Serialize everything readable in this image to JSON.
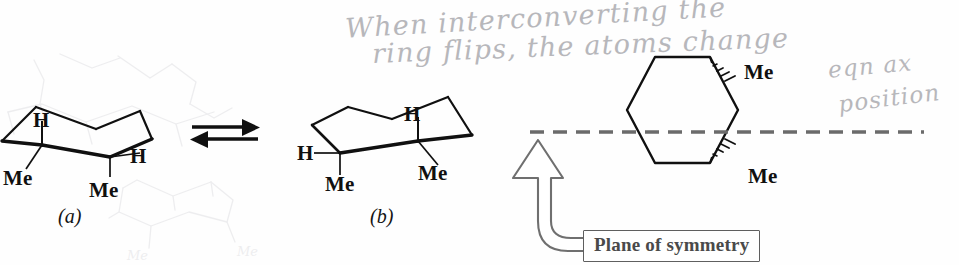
{
  "figure": {
    "type": "chemistry-structure-diagram",
    "background_color": "#fefefe",
    "bond_color": "#101010",
    "plane_line_color": "#6b6b6b",
    "annotation_color": "#b2b2b6"
  },
  "chair_a": {
    "caption": "(a)",
    "labels": {
      "axial_h": "H",
      "equatorial_h": "H",
      "methyl_left": "Me",
      "methyl_right": "Me"
    }
  },
  "chair_b": {
    "caption": "(b)",
    "labels": {
      "axial_h": "H",
      "equatorial_h": "H",
      "methyl_left": "Me",
      "methyl_right": "Me"
    }
  },
  "equilibrium_arrow": {
    "name": "ring-flip-equilibrium-arrow",
    "direction": "bidirectional"
  },
  "hexagon": {
    "methyl_top": "Me",
    "methyl_bottom": "Me",
    "plane_label": "Plane of symmetry",
    "plane_style": "dashed"
  },
  "handwriting": {
    "line1": "When interconverting the",
    "line2": "ring flips, the atoms change",
    "line3": "eqn ax",
    "line4": "position"
  }
}
